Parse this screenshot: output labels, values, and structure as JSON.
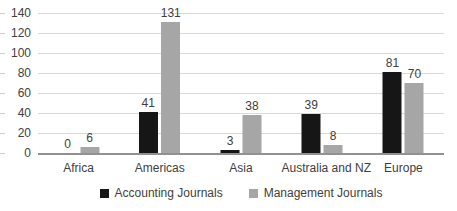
{
  "chart_data": {
    "type": "bar",
    "title": "",
    "categories": [
      "Africa",
      "Americas",
      "Asia",
      "Australia and NZ",
      "Europe"
    ],
    "series": [
      {
        "name": "Accounting Journals",
        "color": "#161616",
        "values": [
          0,
          41,
          3,
          39,
          81
        ]
      },
      {
        "name": "Management Journals",
        "color": "#a6a6a6",
        "values": [
          6,
          131,
          38,
          8,
          70
        ]
      }
    ],
    "value_labels_shown": true,
    "xlabel": "",
    "ylabel": "",
    "ylim": [
      0,
      140
    ],
    "yticks": [
      0,
      20,
      40,
      60,
      80,
      100,
      120,
      140
    ],
    "grid": "horizontal",
    "legend_position": "bottom",
    "colors": {
      "gridline": "#d9d9d9",
      "axis_line": "#919191",
      "text": "#404040",
      "background": "#ffffff"
    }
  }
}
